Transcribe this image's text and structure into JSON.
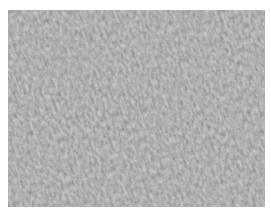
{
  "image": {
    "subject": "grayscale micrograph of densely packed spindle-shaped cells",
    "base_color": "#6e6e6e",
    "light_color": "#bdbdbd",
    "dark_color": "#2e2e2e",
    "background": "#ffffff"
  }
}
